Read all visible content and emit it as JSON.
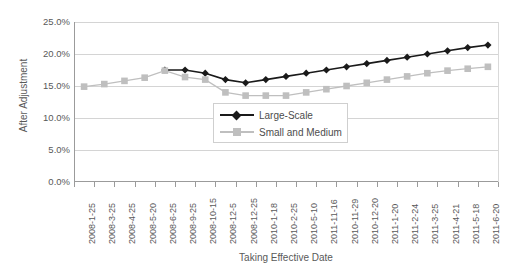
{
  "chart_data": {
    "type": "line",
    "title": "",
    "xlabel": "Taking Effective Date",
    "ylabel": "After Adjustment",
    "ylim": [
      0,
      25
    ],
    "ytick_labels": [
      "25.0%",
      "20.0%",
      "15.0%",
      "10.0%",
      "5.0%",
      "0.0%"
    ],
    "ytick_values": [
      25,
      20,
      15,
      10,
      5,
      0
    ],
    "grid": true,
    "legend_position": "center",
    "categories": [
      "2008-1-25",
      "2008-3-25",
      "2008-4-25",
      "2008-5-20",
      "2008-6-25",
      "2008-9-25",
      "2008-10-15",
      "2008-12-5",
      "2008-12-25",
      "2010-1-18",
      "2010-2-25",
      "2010-5-10",
      "2011-11-16",
      "2010-11-29",
      "2010-12-20",
      "2011-1-20",
      "2011-2-24",
      "2011-3-25",
      "2011-4-21",
      "2011-5-18",
      "2011-6-20"
    ],
    "series": [
      {
        "name": "Large-Scale",
        "color": "#1a1a1a",
        "marker": "diamond",
        "values": [
          null,
          null,
          null,
          null,
          17.5,
          17.5,
          17.0,
          16.0,
          15.5,
          16.0,
          16.5,
          17.0,
          17.5,
          18.0,
          18.5,
          19.0,
          19.5,
          20.0,
          20.5,
          21.0,
          21.4
        ]
      },
      {
        "name": "Small and Medium",
        "color": "#bfbfbf",
        "marker": "square",
        "values": [
          14.9,
          15.3,
          15.8,
          16.3,
          17.4,
          16.4,
          16.0,
          14.0,
          13.5,
          13.5,
          13.5,
          14.0,
          14.5,
          15.0,
          15.5,
          16.0,
          16.5,
          17.0,
          17.4,
          17.7,
          18.0
        ]
      }
    ]
  },
  "legend": {
    "items": [
      {
        "label": "Large-Scale"
      },
      {
        "label": "Small and Medium"
      }
    ]
  }
}
